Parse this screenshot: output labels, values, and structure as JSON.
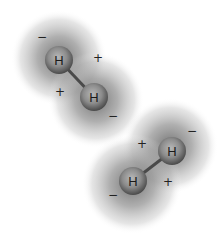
{
  "diagram": {
    "title": "",
    "molecules": [
      {
        "name": "H2 molecule top",
        "atoms": [
          {
            "label": "H",
            "x": 59,
            "y": 60
          },
          {
            "label": "H",
            "x": 94,
            "y": 97
          }
        ],
        "charges": [
          {
            "symbol": "−",
            "x": 42,
            "y": 37
          },
          {
            "symbol": "+",
            "x": 98,
            "y": 58
          },
          {
            "symbol": "+",
            "x": 60,
            "y": 92
          },
          {
            "symbol": "−",
            "x": 113,
            "y": 116
          }
        ]
      },
      {
        "name": "H2 molecule bottom",
        "atoms": [
          {
            "label": "H",
            "x": 172,
            "y": 151
          },
          {
            "label": "H",
            "x": 133,
            "y": 181
          }
        ],
        "charges": [
          {
            "symbol": "+",
            "x": 142,
            "y": 144
          },
          {
            "symbol": "−",
            "x": 192,
            "y": 131
          },
          {
            "symbol": "+",
            "x": 168,
            "y": 182
          },
          {
            "symbol": "−",
            "x": 113,
            "y": 195
          }
        ]
      }
    ],
    "colors": {
      "cloud": "#7a7a7a",
      "atom": "#8a8a8a",
      "bond": "#555555",
      "background": "#ffffff"
    }
  }
}
